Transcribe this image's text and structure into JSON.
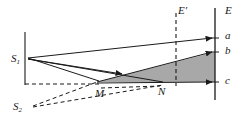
{
  "figure": {
    "title": "",
    "labels": {
      "source_primary": "S",
      "source_primary_sub": "1",
      "source_secondary": "S",
      "source_secondary_sub": "2",
      "point_m": "M",
      "point_n": "N",
      "screen_reference": "E′",
      "screen": "E",
      "screen_point_a": "a",
      "screen_point_b": "b",
      "screen_point_c": "c"
    },
    "colors": {
      "stroke": "#1a1a1a",
      "shade_fill": "#a8a8a8",
      "background": "#ffffff"
    },
    "geometry": {
      "s1": [
        27,
        58
      ],
      "s2": [
        32,
        106
      ],
      "m": [
        97,
        82
      ],
      "n": [
        163,
        82
      ],
      "screen_x": 215,
      "screen_top_y": 8,
      "screen_bottom_y": 100,
      "point_a": [
        215,
        38
      ],
      "point_b": [
        215,
        52
      ],
      "point_c": [
        215,
        82
      ],
      "eprime_x": 176,
      "eprime_top_y": 13,
      "eprime_bottom_y": 86,
      "aperture_x": 25,
      "aperture_top_y": 32,
      "aperture_bottom_y": 85
    },
    "elements": [
      {
        "name": "aperture-edge-line",
        "type": "solid-line"
      },
      {
        "name": "ray-s1-to-a",
        "type": "solid-arrow"
      },
      {
        "name": "ray-s1-to-m",
        "type": "solid-line"
      },
      {
        "name": "ray-s1-to-n",
        "type": "solid-arrow"
      },
      {
        "name": "ray-m-to-b",
        "type": "solid-arrow"
      },
      {
        "name": "ray-n-to-c",
        "type": "solid-arrow"
      },
      {
        "name": "shaded-overlap-region",
        "type": "filled-polygon"
      },
      {
        "name": "dashed-axis-line",
        "type": "dashed-line"
      },
      {
        "name": "ray-s2-to-m",
        "type": "dashed-line"
      },
      {
        "name": "ray-s2-to-n",
        "type": "dashed-line"
      },
      {
        "name": "screen-line-E",
        "type": "solid-line"
      },
      {
        "name": "reference-line-Eprime",
        "type": "dashed-line"
      }
    ]
  }
}
